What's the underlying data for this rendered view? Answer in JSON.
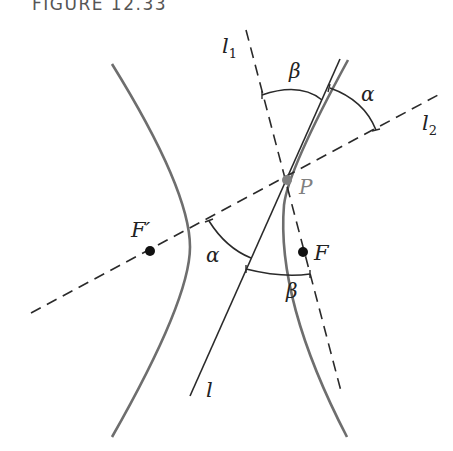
{
  "caption": "FIGURE 12.33",
  "labels": {
    "l1": "l",
    "l1_sub": "1",
    "l2": "l",
    "l2_sub": "2",
    "l": "l",
    "P": "P",
    "F": "F",
    "F_prime": "F′",
    "alpha_top": "α",
    "beta_top": "β",
    "alpha_bottom": "α",
    "beta_bottom": "β"
  },
  "colors": {
    "hyperbola": "#6e6e6e",
    "lines": "#2a2a2a",
    "point_P": "#808080",
    "foci": "#111111"
  }
}
